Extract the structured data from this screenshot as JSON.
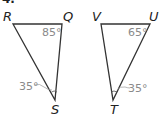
{
  "problem": {
    "number": "4."
  },
  "triangle_left": {
    "vertices": {
      "R": "R",
      "Q": "Q",
      "S": "S"
    },
    "angles": {
      "Q": "85°",
      "S": "35°"
    }
  },
  "triangle_right": {
    "vertices": {
      "V": "V",
      "U": "U",
      "T": "T"
    },
    "angles": {
      "U": "65°",
      "T": "35°"
    }
  },
  "colors": {
    "line": "#333333",
    "angle_label": "#8a8a8a",
    "vertex_label": "#222222"
  }
}
